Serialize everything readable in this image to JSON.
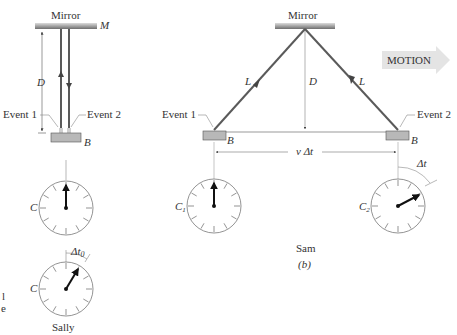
{
  "panel_a": {
    "mirror_label": "Mirror",
    "mirror_symbol": "M",
    "distance_label": "D",
    "event1_label": "Event 1",
    "event2_label": "Event 2",
    "box_label": "B",
    "clock_top_label": "C",
    "clock_bottom_label": "C",
    "interval_label": "Δt",
    "interval_subscript": "0",
    "observer_label": "Sally",
    "caption_fragment_1": "l",
    "caption_fragment_2": "e"
  },
  "panel_b": {
    "mirror_label": "Mirror",
    "path_label_left": "L",
    "path_label_right": "L",
    "distance_label": "D",
    "motion_label": "MOTION",
    "event1_label": "Event 1",
    "event2_label": "Event 2",
    "box_label_left": "B",
    "box_label_right": "B",
    "displacement_label": "v Δt",
    "clock1_label": "C",
    "clock1_subscript": "1",
    "clock2_label": "C",
    "clock2_subscript": "2",
    "interval_label": "Δt",
    "observer_label": "Sam",
    "panel_caption": "(b)"
  },
  "colors": {
    "beam": "#5a5a5a",
    "mirror_dark": "#7a7a7a",
    "mirror_light": "#d8d8d8",
    "box_fill": "#b8b8b8",
    "motion_arrow": "#e4e4e4",
    "clock_stroke": "#777777",
    "hand": "#111111"
  }
}
